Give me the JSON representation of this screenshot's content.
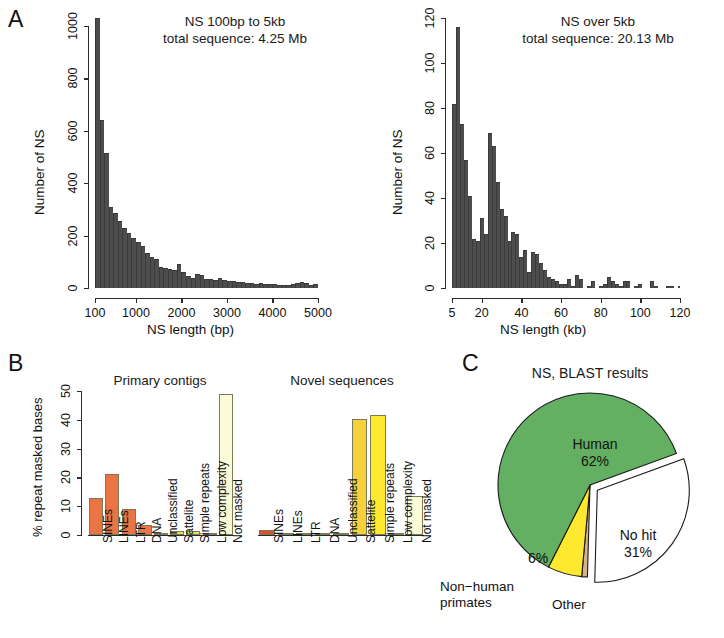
{
  "figure": {
    "panels": [
      {
        "letter": "A"
      },
      {
        "letter": "B"
      },
      {
        "letter": "C"
      }
    ]
  },
  "panelA": {
    "letter": "A",
    "hist1": {
      "title": "NS 100bp to 5kb\ntotal sequence: 4.25 Mb",
      "xlabel": "NS length (bp)",
      "ylabel": "Number of NS",
      "xticks": [
        "100",
        "1000",
        "2000",
        "3000",
        "4000",
        "5000"
      ],
      "yticks": [
        "0",
        "200",
        "400",
        "600",
        "800",
        "1000"
      ]
    },
    "hist2": {
      "title": "NS over 5kb\ntotal sequence: 20.13 Mb",
      "xlabel": "NS length (kb)",
      "ylabel": "Number of NS",
      "xticks": [
        "5",
        "20",
        "40",
        "60",
        "80",
        "100",
        "120"
      ],
      "yticks": [
        "0",
        "20",
        "40",
        "60",
        "80",
        "100",
        "120"
      ]
    }
  },
  "panelB": {
    "letter": "B",
    "ylabel": "% repeat masked bases",
    "yticks": [
      "0",
      "10",
      "20",
      "30",
      "40",
      "50"
    ],
    "chart1_title": "Primary contigs",
    "chart2_title": "Novel sequences",
    "categories": [
      "SINEs",
      "LINEs",
      "LTR",
      "DNA",
      "Unclassified",
      "Sattelite",
      "Simple repeats",
      "Low complexity",
      "Not masked"
    ]
  },
  "panelC": {
    "letter": "C",
    "title": "NS, BLAST results",
    "labels": {
      "human": "Human\n62%",
      "nohit": "No hit\n31%",
      "nonhuman": "Non−human\nprimates",
      "pct6": "6%",
      "other": "Other"
    }
  },
  "colors": {
    "histogram_bar": "#4d4d4d",
    "orange": "#ea7443",
    "yellow_olive": "#e3e05c",
    "yellow": "#ffe92e",
    "gold": "#f7d13c",
    "cream": "#fbfbd8",
    "green": "#63b063",
    "white": "#ffffff",
    "tan": "#d6b48a",
    "axis": "#2b2b2b"
  },
  "chart_data": [
    {
      "type": "bar",
      "id": "hist-ns-100bp-5kb",
      "title": "NS 100bp to 5kb total sequence: 4.25 Mb",
      "xlabel": "NS length (bp)",
      "ylabel": "Number of NS",
      "xlim": [
        100,
        5000
      ],
      "ylim": [
        0,
        1030
      ],
      "bin_width": 100,
      "bin_starts": [
        100,
        200,
        300,
        400,
        500,
        600,
        700,
        800,
        900,
        1000,
        1100,
        1200,
        1300,
        1400,
        1500,
        1600,
        1700,
        1800,
        1900,
        2000,
        2100,
        2200,
        2300,
        2400,
        2500,
        2600,
        2700,
        2800,
        2900,
        3000,
        3100,
        3200,
        3300,
        3400,
        3500,
        3600,
        3700,
        3800,
        3900,
        4000,
        4100,
        4200,
        4300,
        4400,
        4500,
        4600,
        4700,
        4800,
        4900
      ],
      "values": [
        1030,
        640,
        515,
        310,
        285,
        255,
        230,
        210,
        190,
        175,
        160,
        135,
        120,
        110,
        80,
        78,
        72,
        68,
        90,
        62,
        45,
        40,
        52,
        48,
        36,
        34,
        32,
        38,
        30,
        28,
        26,
        24,
        22,
        20,
        18,
        16,
        20,
        16,
        14,
        14,
        12,
        12,
        12,
        14,
        20,
        22,
        20,
        12,
        14
      ],
      "grid": false
    },
    {
      "type": "bar",
      "id": "hist-ns-over-5kb",
      "title": "NS over 5kb total sequence: 20.13 Mb",
      "xlabel": "NS length (kb)",
      "ylabel": "Number of NS",
      "xlim": [
        5,
        120
      ],
      "ylim": [
        0,
        120
      ],
      "bin_width": 2,
      "bin_starts": [
        5,
        7,
        9,
        11,
        13,
        15,
        17,
        19,
        21,
        23,
        25,
        27,
        29,
        31,
        33,
        35,
        37,
        39,
        41,
        43,
        45,
        47,
        49,
        51,
        53,
        55,
        57,
        59,
        61,
        63,
        65,
        67,
        69,
        71,
        73,
        75,
        77,
        79,
        81,
        83,
        85,
        87,
        89,
        91,
        93,
        95,
        97,
        99,
        101,
        103,
        105,
        107,
        109,
        111,
        113,
        115,
        117,
        119
      ],
      "values": [
        82,
        116,
        73,
        57,
        41,
        22,
        21,
        31,
        24,
        69,
        63,
        47,
        35,
        32,
        21,
        25,
        24,
        14,
        17,
        7,
        16,
        15,
        11,
        8,
        5,
        4,
        3,
        2,
        2,
        4,
        1,
        6,
        4,
        0,
        1,
        3,
        0,
        1,
        2,
        5,
        3,
        2,
        1,
        3,
        3,
        0,
        1,
        2,
        0,
        0,
        3,
        1,
        0,
        0,
        1,
        1,
        0,
        1
      ],
      "grid": false
    },
    {
      "type": "bar",
      "id": "repeat-masked-primary-contigs",
      "title": "Primary contigs",
      "ylabel": "% repeat masked bases",
      "ylim": [
        0,
        50
      ],
      "categories": [
        "SINEs",
        "LINEs",
        "LTR",
        "DNA",
        "Unclassified",
        "Sattelite",
        "Simple repeats",
        "Low complexity",
        "Not masked"
      ],
      "values": [
        13.0,
        21.2,
        9.0,
        3.4,
        0.15,
        1.5,
        1.5,
        0.2,
        49.0
      ],
      "bar_colors": [
        "#ea7443",
        "#ea7443",
        "#ea7443",
        "#ea7443",
        "#eda35c",
        "#e3e05c",
        "#e3e05c",
        "#ebe98e",
        "#fbfbd8"
      ],
      "grid": false
    },
    {
      "type": "bar",
      "id": "repeat-masked-novel-sequences",
      "title": "Novel sequences",
      "ylabel": "% repeat masked bases",
      "ylim": [
        0,
        50
      ],
      "categories": [
        "SINEs",
        "LINEs",
        "LTR",
        "DNA",
        "Unclassified",
        "Sattelite",
        "Simple repeats",
        "Low complexity",
        "Not masked"
      ],
      "values": [
        1.6,
        0.8,
        0.2,
        0.1,
        0.3,
        40.3,
        41.5,
        0.7,
        13.5
      ],
      "bar_colors": [
        "#d9512f",
        "#e06a3c",
        "#e8854a",
        "#eda35c",
        "#efc35a",
        "#f7d13c",
        "#ffe92e",
        "#f2e85e",
        "#fbfbd8"
      ],
      "grid": false
    },
    {
      "type": "pie",
      "id": "ns-blast-results",
      "title": "NS, BLAST results",
      "labels": [
        "Human",
        "No hit",
        "Non−human primates",
        "Other"
      ],
      "values": [
        62,
        31,
        6,
        1
      ],
      "display_values": [
        "62%",
        "31%",
        "6%",
        ""
      ],
      "slice_colors": [
        "#63b063",
        "#ffffff",
        "#ffe92e",
        "#d6b48a"
      ],
      "exploded": [
        "No hit"
      ],
      "start_angle_deg": 0
    }
  ]
}
